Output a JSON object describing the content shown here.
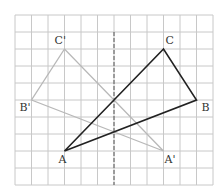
{
  "diagram": {
    "grid": {
      "origin_px": [
        15,
        15
      ],
      "cell_w": 16.5,
      "cell_h": 17,
      "cols": 12,
      "rows": 10,
      "line_color": "#c8c8c8"
    },
    "axis": {
      "type": "dashed-vertical",
      "col": 6,
      "row_start": 1,
      "row_end": 10,
      "color": "#555555"
    },
    "triangles": [
      {
        "name": "ABC",
        "role": "original",
        "color": "#222222",
        "vertices": [
          {
            "label": "A",
            "col": 3,
            "row": 8,
            "label_dx": -6,
            "label_dy": 12
          },
          {
            "label": "B",
            "col": 11,
            "row": 5,
            "label_dx": 5,
            "label_dy": 11
          },
          {
            "label": "C",
            "col": 9,
            "row": 2,
            "label_dx": 2,
            "label_dy": -5
          }
        ]
      },
      {
        "name": "A'B'C'",
        "role": "reflection",
        "color": "#b8b8b8",
        "vertices": [
          {
            "label": "A'",
            "col": 9,
            "row": 8,
            "label_dx": 1,
            "label_dy": 12
          },
          {
            "label": "B'",
            "col": 1,
            "row": 5,
            "label_dx": -12,
            "label_dy": 11
          },
          {
            "label": "C'",
            "col": 3,
            "row": 2,
            "label_dx": -10,
            "label_dy": -5
          }
        ]
      }
    ]
  }
}
